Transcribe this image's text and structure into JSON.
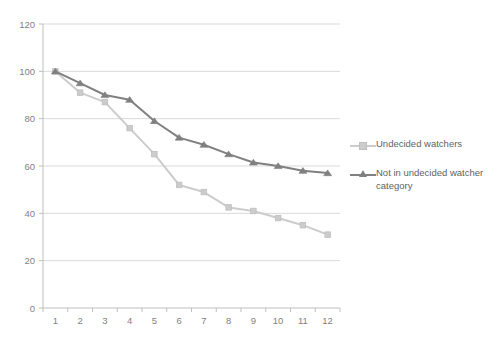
{
  "top_clipped_text": "",
  "legend": {
    "position": "right",
    "entries": [
      {
        "label": "Undecided watchers",
        "color": "#cccccc",
        "marker": "square"
      },
      {
        "label": "Not in undecided watcher category",
        "color": "#808080",
        "marker": "triangle"
      }
    ]
  },
  "chart_data": {
    "type": "line",
    "title": "",
    "xlabel": "",
    "ylabel": "",
    "x": [
      1,
      2,
      3,
      4,
      5,
      6,
      7,
      8,
      9,
      10,
      11,
      12
    ],
    "categories": [
      "1",
      "2",
      "3",
      "4",
      "5",
      "6",
      "7",
      "8",
      "9",
      "10",
      "11",
      "12"
    ],
    "ylim": [
      0,
      120
    ],
    "yticks": [
      0,
      20,
      40,
      60,
      80,
      100,
      120
    ],
    "ytick_labels": [
      "0",
      "20",
      "40",
      "60",
      "80",
      "100",
      "120"
    ],
    "grid": true,
    "grid_axis": "y",
    "series": [
      {
        "name": "Undecided watchers",
        "color": "#cccccc",
        "marker": "square",
        "values": [
          100,
          91,
          87,
          76,
          65,
          52,
          49,
          42.5,
          41,
          38,
          35,
          31
        ]
      },
      {
        "name": "Not in undecided watcher category",
        "color": "#808080",
        "marker": "triangle",
        "values": [
          100,
          95,
          90,
          88,
          79,
          72,
          69,
          65,
          61.5,
          60,
          58,
          57
        ]
      }
    ]
  }
}
